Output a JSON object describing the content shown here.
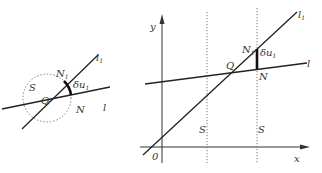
{
  "left_figure": {
    "labels": {
      "S": "S",
      "N1": "N",
      "N1_sub": "1",
      "l1": "l",
      "l1_sub": "1",
      "Q": "Q",
      "N": "N",
      "l": "l",
      "delta": "δu",
      "delta_sub": "1"
    }
  },
  "right_figure": {
    "labels": {
      "y_axis": "y",
      "x_axis": "x",
      "origin": "0",
      "l1": "l",
      "l1_sub": "1",
      "l": "l",
      "N1": "N",
      "N1_sub": "1",
      "Q": "Q",
      "N": "N",
      "S_left": "S",
      "S_right": "S",
      "delta": "δu",
      "delta_sub": "1"
    }
  },
  "colors": {
    "ink": "#222222",
    "dotted": "#666666"
  }
}
